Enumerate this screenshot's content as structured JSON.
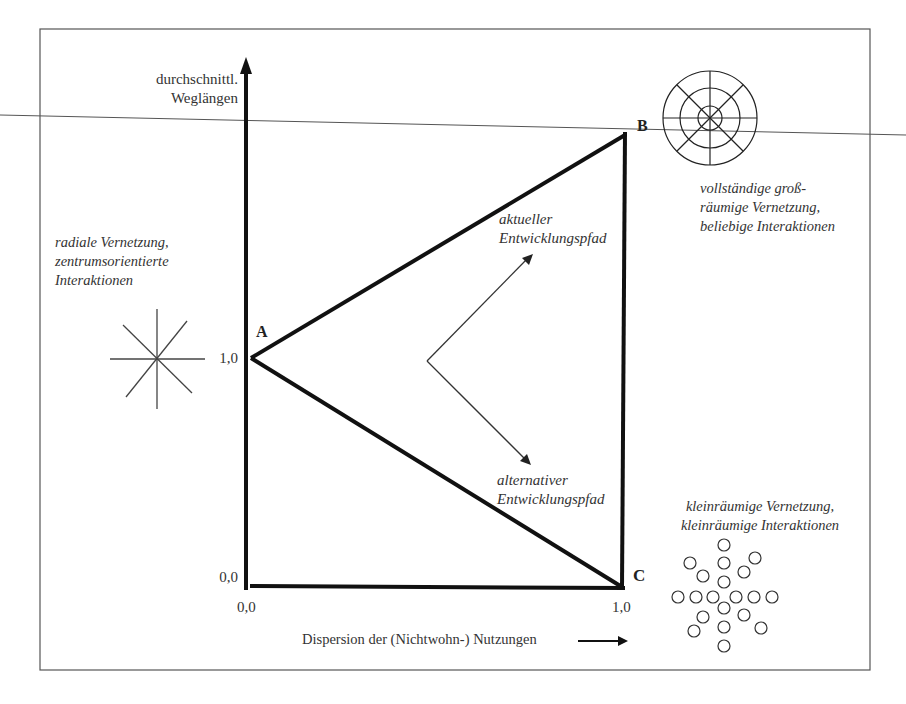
{
  "diagram": {
    "axes": {
      "y_label_line1": "durchschnittl.",
      "y_label_line2": "Weglängen",
      "x_label": "Dispersion der (Nichtwohn-) Nutzungen",
      "y_tick_top": "1,0",
      "y_tick_origin": "0,0",
      "x_tick_origin": "0,0",
      "x_tick_end": "1,0"
    },
    "points": {
      "A": "A",
      "B": "B",
      "C": "C"
    },
    "paths": {
      "current_line1": "aktueller",
      "current_line2": "Entwicklungspfad",
      "alternative_line1": "alternativer",
      "alternative_line2": "Entwicklungspfad"
    },
    "annotations": {
      "radial_line1": "radiale Vernetzung,",
      "radial_line2": "zentrumsorientierte",
      "radial_line3": "Interaktionen",
      "full_line1": "vollständige groß-",
      "full_line2": "räumige Vernetzung,",
      "full_line3": "beliebige Interaktionen",
      "small_line1": "kleinräumige Vernetzung,",
      "small_line2": "kleinräumige Interaktionen"
    },
    "colors": {
      "ink": "#111111",
      "frame": "#555555",
      "text": "#333333"
    }
  }
}
